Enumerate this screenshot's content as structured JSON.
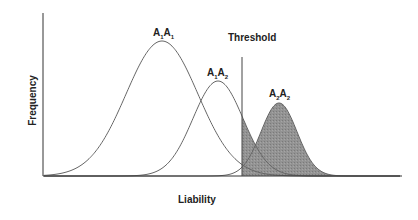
{
  "chart_data": {
    "type": "line",
    "title": "",
    "xlabel": "Liability",
    "ylabel": "Frequency",
    "grid": false,
    "legend": "none",
    "series": [
      {
        "name": "A1A1",
        "mean": 162,
        "sd": 36,
        "peak": 135,
        "label_main": "A",
        "label_sub1": "1",
        "label_sub2": "1"
      },
      {
        "name": "A1A2",
        "mean": 218,
        "sd": 25,
        "peak": 95,
        "label_main": "A",
        "label_sub1": "1",
        "label_sub2": "2"
      },
      {
        "name": "A2A2",
        "mean": 279,
        "sd": 18,
        "peak": 73,
        "label_main": "A",
        "label_sub1": "2",
        "label_sub2": "2"
      }
    ],
    "threshold": {
      "label": "Threshold",
      "x": 242
    },
    "shaded_region": "area right of threshold under all curves",
    "colors": {
      "line": "#666666",
      "shade": "#8f8f8f",
      "axis": "#333333"
    }
  },
  "labels": {
    "threshold": "Threshold",
    "xlabel": "Liability",
    "ylabel": "Frequency",
    "a1a1": {
      "main1": "A",
      "sub1": "1",
      "main2": "A",
      "sub2": "1"
    },
    "a1a2": {
      "main1": "A",
      "sub1": "1",
      "main2": "A",
      "sub2": "2"
    },
    "a2a2": {
      "main1": "A",
      "sub1": "2",
      "main2": "A",
      "sub2": "2"
    }
  }
}
